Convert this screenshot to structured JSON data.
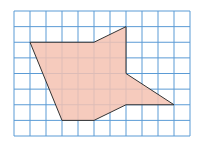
{
  "diagram": {
    "type": "polygon-on-grid",
    "grid": {
      "columns": 11,
      "rows": 8,
      "origin_x": 14,
      "origin_y": 11,
      "cell_w": 16,
      "cell_h": 15.625,
      "line_color": "#5b9bd5",
      "background": "#ffffff"
    },
    "polygon": {
      "fill": "#f4c2b2",
      "stroke": "#333333",
      "vertices_grid": [
        [
          1,
          2
        ],
        [
          5,
          2
        ],
        [
          7,
          1
        ],
        [
          7,
          4
        ],
        [
          10,
          6
        ],
        [
          7,
          6
        ],
        [
          5,
          7
        ],
        [
          3,
          7
        ]
      ]
    }
  }
}
